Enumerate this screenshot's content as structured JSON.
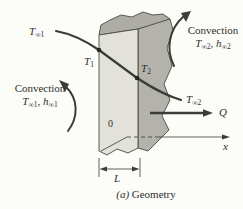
{
  "figure": {
    "caption_prefix": "(a)",
    "caption_label": "Geometry"
  },
  "labels": {
    "t_inf_1": {
      "base": "T",
      "sub": "∞1"
    },
    "t_1": {
      "base": "T",
      "sub": "1"
    },
    "t_2": {
      "base": "T",
      "sub": "2"
    },
    "t_inf_2": {
      "base": "T",
      "sub": "∞2"
    },
    "origin": "0",
    "length": "L",
    "heat": "Q",
    "axis_x": "x"
  },
  "convection_left": {
    "title": "Convection",
    "t": {
      "base": "T",
      "sub": "∞1"
    },
    "sep": ", ",
    "h": {
      "base": "h",
      "sub": "∞1"
    }
  },
  "convection_right": {
    "title": "Convection",
    "t": {
      "base": "T",
      "sub": "∞2"
    },
    "sep": ", ",
    "h": {
      "base": "h",
      "sub": "∞2"
    }
  },
  "colors": {
    "background": "#fcfcf9",
    "wall_front": "#e2e2da",
    "wall_side": "#b3b3ab",
    "wall_top": "#adada5",
    "line": "#3b3b37",
    "dot": "#262624"
  }
}
